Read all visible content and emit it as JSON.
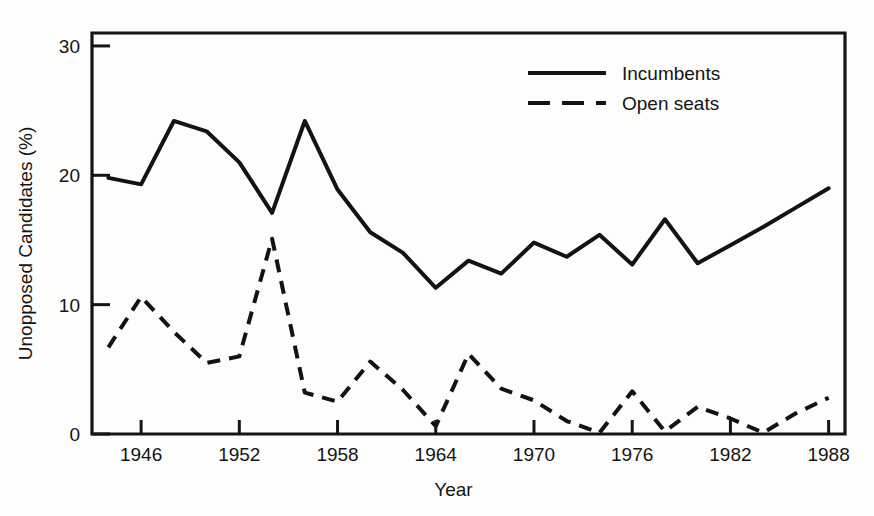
{
  "chart_data": {
    "type": "line",
    "title": "",
    "xlabel": "Year",
    "ylabel": "Unopposed Candidates (%)",
    "xlim": [
      1943,
      1989
    ],
    "ylim": [
      0,
      31
    ],
    "xticks": [
      1946,
      1952,
      1958,
      1964,
      1970,
      1976,
      1982,
      1988
    ],
    "xticklabels": [
      "1946",
      "1952",
      "1958",
      "1964",
      "1970",
      "1976",
      "1982",
      "1988"
    ],
    "yticks": [
      0,
      10,
      20,
      30
    ],
    "yticklabels": [
      "0",
      "10",
      "20",
      "30"
    ],
    "grid": false,
    "legend_position": "top-right",
    "x": [
      1944,
      1946,
      1948,
      1950,
      1952,
      1954,
      1956,
      1958,
      1960,
      1962,
      1964,
      1966,
      1968,
      1970,
      1972,
      1974,
      1976,
      1978,
      1980,
      1982,
      1984,
      1986,
      1988
    ],
    "series": [
      {
        "name": "Incumbents",
        "style": "solid",
        "values": [
          19.8,
          19.3,
          24.2,
          23.4,
          21.0,
          17.1,
          24.2,
          18.9,
          15.6,
          14.0,
          11.3,
          13.4,
          12.4,
          14.8,
          13.7,
          15.4,
          13.1,
          16.6,
          13.2,
          14.6,
          16.0,
          17.5,
          19.0
        ]
      },
      {
        "name": "Open seats",
        "style": "dashed",
        "values": [
          6.7,
          10.6,
          7.9,
          5.5,
          6.0,
          15.1,
          3.2,
          2.5,
          5.6,
          3.4,
          0.6,
          6.2,
          3.5,
          2.6,
          1.0,
          0.1,
          3.3,
          0.2,
          2.1,
          1.2,
          0.1,
          1.6,
          2.8
        ]
      }
    ]
  },
  "legend": {
    "items": [
      {
        "label": "Incumbents",
        "style": "solid"
      },
      {
        "label": "Open seats",
        "style": "dashed"
      }
    ]
  }
}
